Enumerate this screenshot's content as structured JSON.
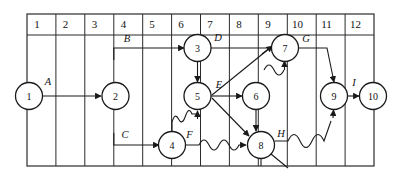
{
  "diagram": {
    "type": "activity-on-node network",
    "grid": {
      "column_headers": [
        "1",
        "2",
        "3",
        "4",
        "5",
        "6",
        "7",
        "8",
        "9",
        "10",
        "11",
        "12"
      ],
      "column_count": 12,
      "header_row_label": "time units",
      "line_color": "#2b2b2b",
      "background_color": "#ffffff"
    },
    "nodes": [
      {
        "id": "1",
        "label": "1",
        "column": 1,
        "row": "middle"
      },
      {
        "id": "2",
        "label": "2",
        "column": 4,
        "row": "middle"
      },
      {
        "id": "3",
        "label": "3",
        "column": 7,
        "row": "top"
      },
      {
        "id": "4",
        "label": "4",
        "column": 6,
        "row": "bottom"
      },
      {
        "id": "5",
        "label": "5",
        "column": 7,
        "row": "middle"
      },
      {
        "id": "6",
        "label": "6",
        "column": 9,
        "row": "middle"
      },
      {
        "id": "7",
        "label": "7",
        "column": 10,
        "row": "top"
      },
      {
        "id": "8",
        "label": "8",
        "column": 9,
        "row": "bottom"
      },
      {
        "id": "9",
        "label": "9",
        "column": 11,
        "row": "middle"
      },
      {
        "id": "10",
        "label": "10",
        "column": 12,
        "row": "middle"
      }
    ],
    "edges": [
      {
        "label": "A",
        "from": "1",
        "to": "2",
        "style": "straight"
      },
      {
        "label": "B",
        "from": "2",
        "to": "3",
        "style": "straight"
      },
      {
        "label": "C",
        "from": "2",
        "to": "4",
        "style": "straight"
      },
      {
        "label": "D",
        "from": "3",
        "to": "7",
        "style": "straight"
      },
      {
        "label": "E",
        "from": "5",
        "to": "6",
        "style": "straight"
      },
      {
        "label": "F",
        "from": "4",
        "to": "5",
        "style": "wavy"
      },
      {
        "label": "G",
        "from": "7",
        "to": "9",
        "style": "straight"
      },
      {
        "label": "H",
        "from": "8",
        "to": "9",
        "style": "wavy"
      },
      {
        "label": "I",
        "from": "9",
        "to": "10",
        "style": "straight"
      }
    ],
    "edge_labels": [
      "A",
      "B",
      "C",
      "D",
      "E",
      "F",
      "G",
      "H",
      "I"
    ],
    "line_color": "#1a1a1a"
  }
}
